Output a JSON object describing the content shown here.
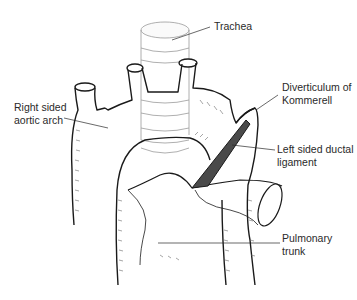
{
  "diagram": {
    "labels": [
      {
        "id": "trachea",
        "lines": [
          "Trachea"
        ]
      },
      {
        "id": "right-aortic-arch",
        "lines": [
          "Right sided",
          "aortic arch"
        ]
      },
      {
        "id": "diverticulum",
        "lines": [
          "Diverticulum of",
          "Kommerell"
        ]
      },
      {
        "id": "ductal-ligament",
        "lines": [
          "Left sided ductal",
          "ligament"
        ]
      },
      {
        "id": "pulmonary-trunk",
        "lines": [
          "Pulmonary",
          "trunk"
        ]
      }
    ],
    "colors": {
      "outline": "#1a1a1a",
      "hatch": "#6a6a6a",
      "trachea": "#9a9a9a",
      "text": "#2a2a2a",
      "background": "#ffffff"
    }
  }
}
